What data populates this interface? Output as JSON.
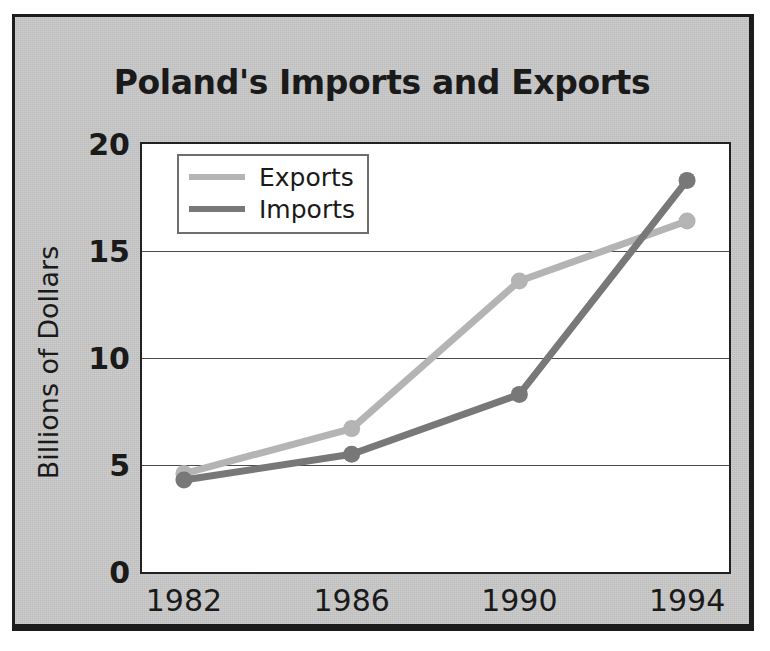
{
  "figure": {
    "title": "Poland's Imports and Exports",
    "background_color": "#c9c9c9",
    "border_color": "#1c1c1c",
    "plot_background_color": "#ffffff"
  },
  "axes": {
    "y_title": "Billions of Dollars",
    "y_ticks": [
      "0",
      "5",
      "10",
      "15",
      "20"
    ],
    "x_ticks": [
      "1982",
      "1986",
      "1990",
      "1994"
    ]
  },
  "legend": {
    "position": "top-left-inside",
    "entries": [
      {
        "label": "Exports",
        "color": "#b4b4b4"
      },
      {
        "label": "Imports",
        "color": "#787878"
      }
    ]
  },
  "chart_data": {
    "type": "line",
    "title": "Poland's Imports and Exports",
    "xlabel": "",
    "ylabel": "Billions of Dollars",
    "x": [
      1982,
      1986,
      1990,
      1994
    ],
    "categories": [
      "1982",
      "1986",
      "1990",
      "1994"
    ],
    "xlim": [
      1981,
      1995
    ],
    "ylim": [
      0,
      20
    ],
    "yticks": [
      0,
      5,
      10,
      15,
      20
    ],
    "grid": "horizontal",
    "legend_position": "upper left",
    "series": [
      {
        "name": "Exports",
        "color": "#b4b4b4",
        "values": [
          4.6,
          6.7,
          13.6,
          16.4
        ]
      },
      {
        "name": "Imports",
        "color": "#787878",
        "values": [
          4.3,
          5.5,
          8.3,
          18.3
        ]
      }
    ]
  }
}
